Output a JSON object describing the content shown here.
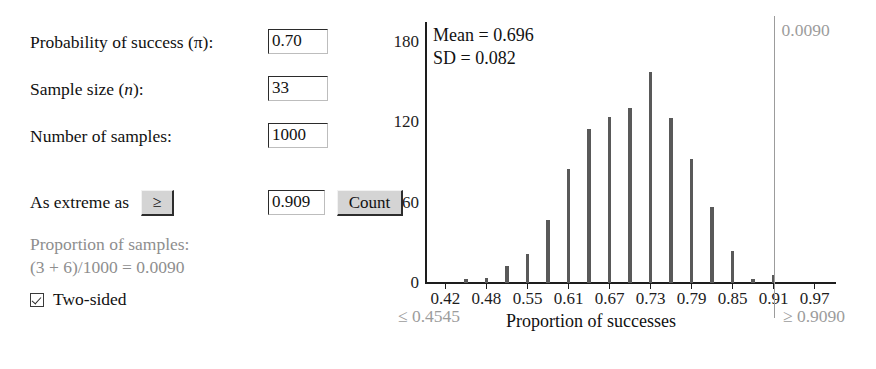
{
  "controls": {
    "prob_label": "Probability of success (π):",
    "prob_value": "0.70",
    "sample_size_label_pre": "Sample size (",
    "sample_size_label_it": "n",
    "sample_size_label_post": "):",
    "sample_size_value": "33",
    "num_samples_label": "Number of samples:",
    "num_samples_value": "1000",
    "as_extreme_label": "As extreme as",
    "operator_button": "≥",
    "extreme_value": "0.909",
    "count_button": "Count",
    "proportion_line1": "Proportion of samples:",
    "proportion_line2": "(3 + 6)/1000 = 0.0090",
    "two_sided_label": "Two-sided",
    "two_sided_checked": true
  },
  "chart_data": {
    "type": "bar",
    "title": "",
    "xlabel": "Proportion of successes",
    "ylabel": "",
    "grid": false,
    "legend": "none",
    "xlim": [
      0.3939,
      1.0
    ],
    "ylim": [
      0,
      195
    ],
    "ytick_labels": [
      "180",
      "120",
      "60",
      "0"
    ],
    "yticks": [
      180,
      120,
      60,
      0
    ],
    "xtick_labels": [
      "0.42",
      "0.48",
      "0.55",
      "0.61",
      "0.67",
      "0.73",
      "0.79",
      "0.85",
      "0.91",
      "0.97"
    ],
    "xticks": [
      0.4242,
      0.4848,
      0.5455,
      0.6061,
      0.6667,
      0.7273,
      0.7879,
      0.8485,
      0.9091,
      0.9697
    ],
    "x": [
      0.4242,
      0.4545,
      0.4848,
      0.5152,
      0.5455,
      0.5758,
      0.6061,
      0.6364,
      0.6667,
      0.697,
      0.7273,
      0.7576,
      0.7879,
      0.8182,
      0.8485,
      0.8788,
      0.9091,
      0.9394,
      0.9697
    ],
    "values": [
      0,
      3,
      4,
      13,
      22,
      47,
      85,
      115,
      124,
      131,
      158,
      123,
      93,
      57,
      24,
      3,
      6,
      0,
      0
    ],
    "annotations": {
      "mean_label": "Mean = 0.696",
      "sd_label": "SD = 0.082",
      "cut_value_label": "0.0090",
      "cut_line_x": 0.9091,
      "left_tail_label": "≤ 0.4545",
      "right_tail_label": "≥ 0.9090"
    },
    "colors": {
      "bar": "#595959",
      "axis": "#1d1d1d",
      "annotation_gray": "#9c9c9c"
    }
  }
}
